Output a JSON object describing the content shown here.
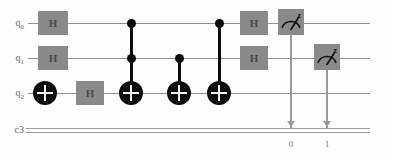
{
  "diagram": {
    "type": "quantum-circuit",
    "colors": {
      "background": "#fdfdfd",
      "quantum_wire": "#8e8e8e",
      "classical_wire": "#9a9a9a",
      "gate_box_fill": "#8a8a8a",
      "gate_box_text": "#4a4a4a",
      "control_black": "#0b0b0b",
      "label_text": "#6b6b6b"
    }
  },
  "registers": [
    {
      "id": "q0",
      "label": "q",
      "subscript": "0",
      "kind": "quantum",
      "y": 23
    },
    {
      "id": "q1",
      "label": "q",
      "subscript": "1",
      "kind": "quantum",
      "y": 58
    },
    {
      "id": "q2",
      "label": "q",
      "subscript": "2",
      "kind": "quantum",
      "y": 93
    },
    {
      "id": "c3",
      "label": "c3",
      "subscript": "",
      "kind": "classical",
      "y": 130
    }
  ],
  "gates": [
    {
      "name": "hadamard-gate",
      "symbol": "H",
      "targets": [
        "q0"
      ],
      "x": 38,
      "y": 11,
      "w": 30,
      "h": 24
    },
    {
      "name": "hadamard-gate",
      "symbol": "H",
      "targets": [
        "q1"
      ],
      "x": 38,
      "y": 46,
      "w": 30,
      "h": 24
    },
    {
      "name": "pauli-x-gate",
      "symbol": "X",
      "targets": [
        "q2"
      ],
      "x": 33,
      "y": 81,
      "w": 24,
      "h": 24
    },
    {
      "name": "hadamard-gate",
      "symbol": "H",
      "targets": [
        "q2"
      ],
      "x": 76,
      "y": 81,
      "w": 28,
      "h": 24
    },
    {
      "name": "toffoli-gate",
      "symbol": "CCX",
      "controls": [
        "q0",
        "q1"
      ],
      "targets": [
        "q2"
      ],
      "x": 119,
      "y": 23,
      "w": 24,
      "h": 24
    },
    {
      "name": "cnot-gate",
      "symbol": "CX",
      "controls": [
        "q1"
      ],
      "targets": [
        "q2"
      ],
      "x": 167,
      "y": 58,
      "w": 24,
      "h": 24
    },
    {
      "name": "cnot-gate",
      "symbol": "CX",
      "controls": [
        "q0"
      ],
      "targets": [
        "q2"
      ],
      "x": 207,
      "y": 23,
      "w": 24,
      "h": 24
    },
    {
      "name": "hadamard-gate",
      "symbol": "H",
      "targets": [
        "q0"
      ],
      "x": 240,
      "y": 11,
      "w": 28,
      "h": 24
    },
    {
      "name": "hadamard-gate",
      "symbol": "H",
      "targets": [
        "q1"
      ],
      "x": 240,
      "y": 46,
      "w": 28,
      "h": 24
    }
  ],
  "measurements": [
    {
      "name": "measure-gate",
      "basis": "z",
      "qubit": "q0",
      "cbit": "0",
      "x": 278,
      "y": 9,
      "w": 26,
      "h": 26,
      "drop_to": 130
    },
    {
      "name": "measure-gate",
      "basis": "z",
      "qubit": "q1",
      "cbit": "1",
      "x": 314,
      "y": 44,
      "w": 26,
      "h": 26,
      "drop_to": 130
    }
  ],
  "classical_bit_labels": [
    {
      "text": "0",
      "x": 284,
      "y": 140
    },
    {
      "text": "1",
      "x": 320,
      "y": 140
    }
  ],
  "wire_extent": {
    "start_x": 28,
    "end_x": 370
  }
}
